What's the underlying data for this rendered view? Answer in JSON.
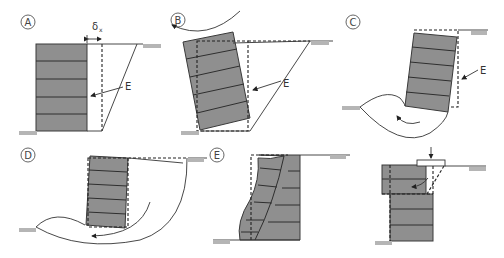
{
  "figure": {
    "panels": [
      {
        "id": "A",
        "label": "A",
        "annotation": "E",
        "symbol": "δ",
        "symbol_sub": "x",
        "mode": "sliding"
      },
      {
        "id": "B",
        "label": "B",
        "annotation": "E",
        "mode": "overturning"
      },
      {
        "id": "C",
        "label": "C",
        "annotation": "E",
        "mode": "bearing failure"
      },
      {
        "id": "D",
        "label": "D",
        "mode": "global slip"
      },
      {
        "id": "E",
        "label": "E",
        "mode": "bulging"
      },
      {
        "id": "F",
        "label": "",
        "mode": "top unit shear under surcharge"
      }
    ],
    "colors": {
      "wall_fill": "#8f8f8f",
      "line": "#333333",
      "hatch": "#b5b5b5",
      "background": "#ffffff"
    }
  }
}
